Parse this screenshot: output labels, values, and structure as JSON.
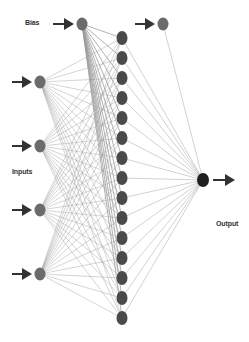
{
  "diagram": {
    "labels": {
      "bias": "Bias",
      "inputs": "Inputs",
      "output": "Output"
    },
    "colors": {
      "background": "#ffffff",
      "input_node": "#6b6b6b",
      "hidden_node": "#4a4a4a",
      "output_node": "#1f1f1f",
      "edge": "#9a9a9a",
      "arrow": "#333333"
    },
    "layers": {
      "bias_input": {
        "x": 82,
        "y": 24,
        "r": 6
      },
      "inputs": [
        {
          "x": 40,
          "y": 82
        },
        {
          "x": 40,
          "y": 146
        },
        {
          "x": 40,
          "y": 210
        },
        {
          "x": 40,
          "y": 274
        }
      ],
      "hidden": {
        "x": 122,
        "y_start": 38,
        "y_end": 318,
        "count": 15
      },
      "bias_hidden": {
        "x": 163,
        "y": 24,
        "r": 6
      },
      "output": {
        "x": 203,
        "y": 180,
        "r": 6
      }
    }
  }
}
